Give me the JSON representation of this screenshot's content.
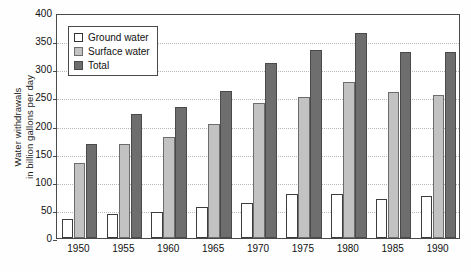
{
  "chart_data": {
    "type": "bar",
    "title": "",
    "xlabel": "",
    "ylabel": "Water withdrawals in billion gallons per day",
    "ylabel_line1": "Water withdrawals",
    "ylabel_line2": "in billion gallons per day",
    "categories": [
      "1950",
      "1955",
      "1960",
      "1965",
      "1970",
      "1975",
      "1980",
      "1985",
      "1990"
    ],
    "series": [
      {
        "name": "Ground water",
        "color": "#ffffff",
        "values": [
          34,
          43,
          46,
          55,
          62,
          78,
          79,
          70,
          75
        ]
      },
      {
        "name": "Surface water",
        "color": "#c2c2c2",
        "values": [
          133,
          168,
          180,
          203,
          240,
          251,
          277,
          259,
          255
        ]
      },
      {
        "name": "Total",
        "color": "#6e6e6e",
        "values": [
          168,
          221,
          233,
          262,
          311,
          335,
          365,
          331,
          330
        ]
      }
    ],
    "ylim": [
      0,
      400
    ],
    "yticks": [
      0,
      50,
      100,
      150,
      200,
      250,
      300,
      350,
      400
    ],
    "ytick_labels": [
      "0",
      "50",
      "100",
      "150",
      "200",
      "250",
      "300",
      "350",
      "400"
    ],
    "grid": true,
    "legend_position": "upper-left",
    "legend_entries": [
      "Ground water",
      "Surface water",
      "Total"
    ]
  }
}
